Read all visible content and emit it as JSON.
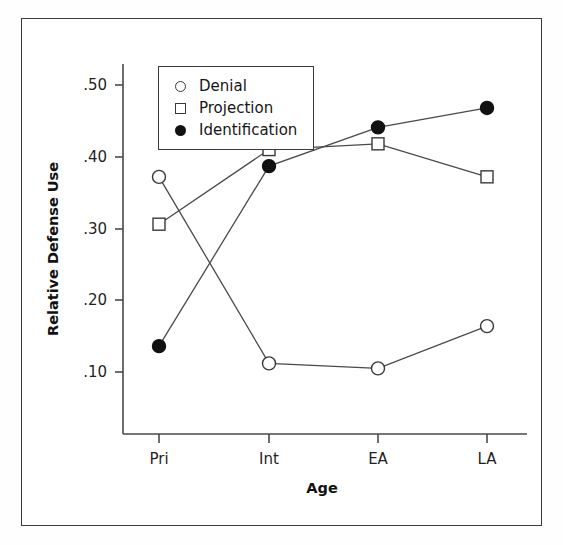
{
  "chart_data": {
    "type": "line",
    "title": "",
    "xlabel": "Age",
    "ylabel": "Relative Defense Use",
    "categories": [
      "Pri",
      "Int",
      "EA",
      "LA"
    ],
    "xtick_labels": [
      "Pri",
      "Int",
      "EA",
      "LA"
    ],
    "ytick_labels": [
      ".10",
      ".20",
      ".30",
      ".40",
      ".50"
    ],
    "ytick_values": [
      0.1,
      0.2,
      0.3,
      0.4,
      0.5
    ],
    "ylim": [
      0.0,
      0.54
    ],
    "grid": false,
    "legend_position": "upper-left-inside",
    "series": [
      {
        "name": "Denial",
        "marker": "open-circle",
        "values": [
          0.372,
          0.112,
          0.105,
          0.164
        ]
      },
      {
        "name": "Projection",
        "marker": "open-square",
        "values": [
          0.306,
          0.41,
          0.418,
          0.372
        ]
      },
      {
        "name": "Identification",
        "marker": "filled-circle",
        "values": [
          0.136,
          0.387,
          0.441,
          0.468
        ]
      }
    ]
  },
  "legend": {
    "entries": [
      {
        "label": "Denial",
        "marker": "open-circle"
      },
      {
        "label": "Projection",
        "marker": "open-square"
      },
      {
        "label": "Identification",
        "marker": "filled-circle"
      }
    ]
  },
  "axes": {
    "y_title": "Relative Defense Use",
    "x_title": "Age"
  },
  "colors": {
    "line": "#4a4a4a",
    "marker_fill": "#111111",
    "marker_open": "#ffffff",
    "frame": "#3a3a3a",
    "text": "#1a1a1a",
    "background": "#ffffff"
  }
}
